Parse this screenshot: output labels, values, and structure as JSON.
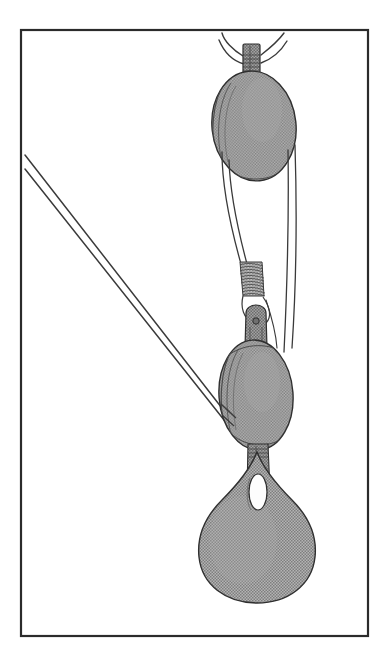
{
  "document": {
    "kind": "technical-line-illustration",
    "title": "Block and Tackle",
    "subject": "Two-sheave rope tackle with suspended load",
    "background_color": "#ffffff",
    "ink_color": "#2b2b2b",
    "fill_gray": "#9a9a9a",
    "fill_gray_dark": "#8a8a8a",
    "fill_gray_light": "#ababab",
    "highlight_white": "#fdfdfd"
  },
  "frame": {
    "name": "plate-border",
    "x": 21,
    "y": 30,
    "width": 347,
    "height": 606,
    "stroke": "#2b2b2b",
    "stroke_width": 2.2,
    "fill": "#ffffff"
  },
  "chart_data": {
    "type": "diagram",
    "title": "Block and Tackle",
    "xlabel": "",
    "ylabel": "",
    "grid": false,
    "legend": "none",
    "xlim": [
      0,
      389
    ],
    "ylim": [
      0,
      663
    ],
    "parts": [
      {
        "id": "upper-block",
        "label": "Upper sheave block",
        "shape": "ellipse",
        "cx": 254,
        "cy": 126,
        "rx": 42,
        "ry": 55,
        "rotation": -6,
        "fill": "#9a9a9a"
      },
      {
        "id": "upper-becket",
        "label": "Upper becket strap",
        "shape": "rect",
        "x": 243,
        "y": 44,
        "width": 17,
        "height": 32,
        "fill": "#9a9a9a"
      },
      {
        "id": "upper-rope-tails",
        "label": "Splayed rope tails at head",
        "shape": "curves",
        "count": 4
      },
      {
        "id": "lower-block",
        "label": "Lower sheave block",
        "shape": "ellipse",
        "cx": 256,
        "cy": 395,
        "rx": 37,
        "ry": 55,
        "rotation": -4,
        "fill": "#9a9a9a"
      },
      {
        "id": "shackle",
        "label": "Shackle with pin eyelet",
        "shape": "rounded-rect",
        "x": 246,
        "y": 310,
        "width": 20,
        "height": 36,
        "fill": "#8a8a8a"
      },
      {
        "id": "shackle-pin-hole",
        "label": "Pin hole",
        "shape": "circle",
        "cx": 256,
        "cy": 321,
        "r": 3.2,
        "fill": "#6f6f6f"
      },
      {
        "id": "rope-seizing",
        "label": "Rope whipping / seizing",
        "shape": "coil",
        "x": 240,
        "y": 262,
        "width": 22,
        "height": 34,
        "turns": 13
      },
      {
        "id": "load-weight",
        "label": "Suspended load (teardrop)",
        "shape": "teardrop",
        "cx": 257,
        "cy": 540,
        "rx": 52,
        "ry": 62,
        "fill": "#9a9a9a"
      },
      {
        "id": "load-eye",
        "label": "Load eye opening",
        "shape": "ellipse",
        "cx": 258,
        "cy": 492,
        "rx": 9,
        "ry": 18,
        "fill": "#fdfdfd"
      },
      {
        "id": "hauling-part-upper",
        "label": "Hauling rope, upper strand",
        "shape": "line",
        "x1": 25,
        "y1": 155,
        "x2": 232,
        "y2": 421
      },
      {
        "id": "hauling-part-lower",
        "label": "Hauling rope, lower strand",
        "shape": "line",
        "x1": 25,
        "y1": 169,
        "x2": 232,
        "y2": 430
      },
      {
        "id": "standing-part-right",
        "label": "Standing rope, right side",
        "shape": "line",
        "x1": 288,
        "y1": 150,
        "x2": 285,
        "y2": 352
      },
      {
        "id": "fall-left",
        "label": "Rope fall, left of sheaves",
        "shape": "line",
        "x1": 226,
        "y1": 160,
        "x2": 242,
        "y2": 266
      }
    ]
  },
  "accessibility": {
    "alt_text": "Line drawing of a block and tackle: an upper oval sheave block hung by a becket with splayed rope tails, rope running down to a lower oval sheave block joined by a shackle and rope seizing, with a teardrop shaped load hanging beneath and two long hauling lines running off to the upper left."
  }
}
